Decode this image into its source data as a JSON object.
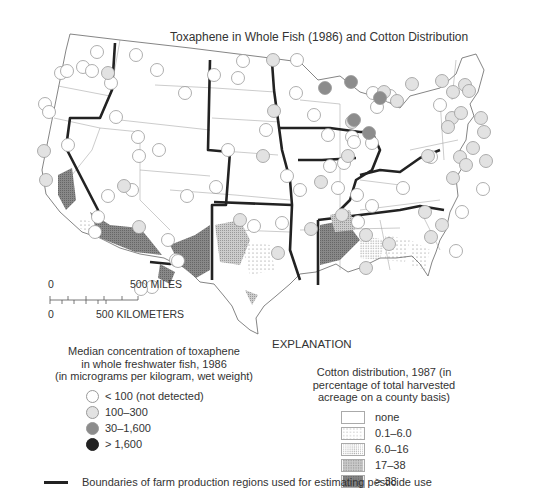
{
  "title": "Toxaphene in Whole Fish (1986) and Cotton Distribution",
  "scale_bar": {
    "zero_miles": "0",
    "miles_label": "500 MILES",
    "zero_km": "0",
    "km_label": "500 KILOMETERS"
  },
  "explanation_heading": "EXPLANATION",
  "fish_legend": {
    "header_lines": [
      "Median concentration of toxaphene",
      "in whole freshwater fish, 1986",
      "(in micrograms per kilogram, wet weight)"
    ],
    "items": [
      {
        "label": "< 100 (not detected)",
        "color": "#ffffff"
      },
      {
        "label": "100–300",
        "color": "#e2e2e2"
      },
      {
        "label": "30–1,600",
        "color": "#8c8c8c"
      },
      {
        "label": "> 1,600",
        "color": "#222222"
      }
    ]
  },
  "cotton_legend": {
    "header_lines": [
      "Cotton distribution, 1987 (in",
      "percentage of total harvested",
      "acreage on a county basis)"
    ],
    "items": [
      {
        "label": "none",
        "pattern": "none"
      },
      {
        "label": "0.1–6.0",
        "pattern": "sparse-dots"
      },
      {
        "label": "6.0–16",
        "pattern": "dense-dots"
      },
      {
        "label": "17–38",
        "pattern": "light-hatch"
      },
      {
        "label": "> 38",
        "pattern": "dark-grid"
      }
    ]
  },
  "boundary_legend": {
    "label": "Boundaries of farm production regions used for estimating pesticide use"
  }
}
